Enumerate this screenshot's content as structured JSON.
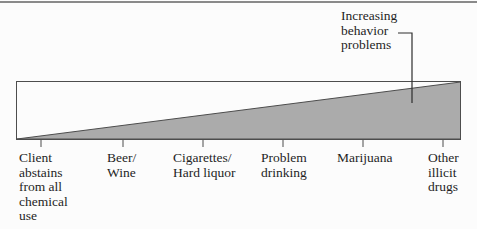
{
  "figure": {
    "annotation": {
      "text": "Increasing\nbehavior\nproblems"
    },
    "continuum": {
      "items": [
        {
          "label": "Client\nabstains\nfrom all\nchemical\nuse"
        },
        {
          "label": "Beer/\nWine"
        },
        {
          "label": "Cigarettes/\nHard liquor"
        },
        {
          "label": "Problem\ndrinking"
        },
        {
          "label": "Marijuana"
        },
        {
          "label": "Other\nillicit\ndrugs"
        }
      ]
    },
    "colors": {
      "wedge_fill": "#ababab",
      "outline": "#4d4d4d",
      "leader_line": "#2e2e2e",
      "top_rule": "#8a8a8a",
      "text": "#1f1f1f",
      "background": "#fcfcfc"
    }
  }
}
